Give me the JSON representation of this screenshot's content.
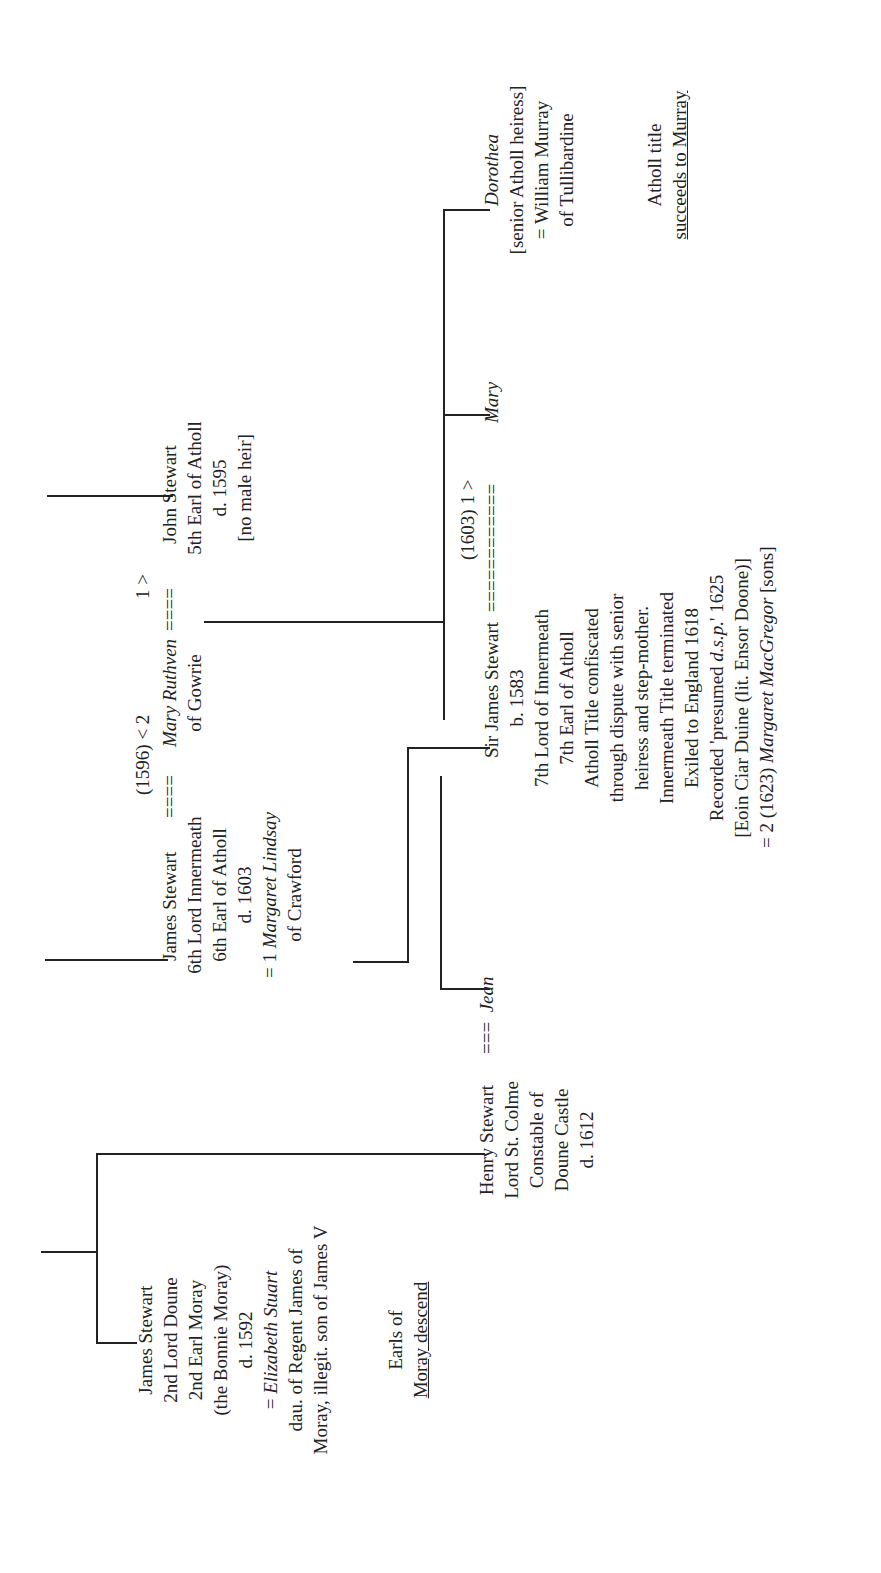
{
  "diagram": {
    "type": "family-tree",
    "orientation": "rotated-90-ccw",
    "moray_branch": {
      "james_2nd_earl": {
        "lines": [
          "James Stewart",
          "2nd Lord Doune",
          "2nd Earl Moray",
          "(the Bonnie Moray)",
          "d. 1592"
        ],
        "spouse_prefix": "= ",
        "spouse_name": "Elizabeth Stuart",
        "spouse_lines": [
          "dau. of Regent James of",
          "Moray, illegit. son of James V"
        ]
      },
      "earls_note": {
        "line1": "Earls of",
        "line2": "Moray descend"
      },
      "henry": {
        "lines": [
          "Henry Stewart",
          "Lord St. Colme",
          "Constable of",
          "Doune Castle",
          "d. 1612"
        ],
        "marriage": "===",
        "spouse": "Jean"
      }
    },
    "atholl_branch": {
      "james_6th": {
        "lines": [
          "James Stewart",
          "6th Lord Innermeath",
          "6th Earl of Atholl",
          "d. 1603"
        ],
        "first_wife_prefix": "= 1 ",
        "first_wife": "Margaret Lindsay",
        "first_wife_of": "of Crawford",
        "marriage": "===="
      },
      "marriage_1596": {
        "label": "(1596) < 2"
      },
      "mary_ruthven": {
        "name": "Mary Ruthven",
        "of": "of Gowrie",
        "marriage": "===="
      },
      "marriage_1_label": "1 >",
      "john_stewart": {
        "lines": [
          "John Stewart",
          "5th Earl of Atholl",
          "d. 1595",
          "[no male heir]"
        ]
      },
      "sir_james": {
        "name": "Sir James Stewart",
        "marriage": "============",
        "lines": [
          "b. 1583",
          "7th Lord of Innermeath",
          "7th Earl of Atholl",
          "Atholl Title confiscated",
          "through dispute with senior",
          "heiress and step-mother.",
          "Innermeath Title terminated",
          "Exiled to England 1618"
        ],
        "recorded_prefix": "Recorded 'presumed ",
        "recorded_italic": "d.s.p.",
        "recorded_suffix": "' 1625",
        "alias": "[Eoin Ciar Duine (lit. Ensor Doone)]",
        "second_wife_prefix": "= 2 (1623) ",
        "second_wife": "Margaret MacGregor",
        "second_wife_suffix": " [sons]"
      },
      "marriage_1603": {
        "label": "(1603) 1 >"
      },
      "mary": {
        "name": "Mary"
      },
      "dorothea": {
        "name": "Dorothea",
        "lines": [
          "[senior Atholl heiress]",
          "= William Murray",
          "of Tullibardine"
        ]
      },
      "atholl_note": {
        "line1": "Atholl title",
        "line2": "succeeds to Murray"
      }
    },
    "colors": {
      "ink": "#222222",
      "background": "#ffffff"
    }
  }
}
